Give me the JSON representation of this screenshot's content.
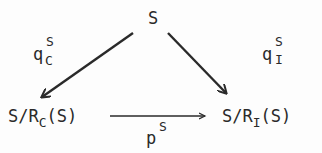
{
  "diagram": {
    "type": "commutative-triangle",
    "nodes": {
      "top": {
        "label": "S"
      },
      "left": {
        "base": "S/R",
        "sub": "C",
        "tail": "(S)"
      },
      "right": {
        "base": "S/R",
        "sub": "I",
        "tail": "(S)"
      }
    },
    "edges": {
      "left_arrow": {
        "from": "top",
        "to": "left",
        "base": "q",
        "sup": "S",
        "sub": "C"
      },
      "right_arrow": {
        "from": "top",
        "to": "right",
        "base": "q",
        "sup": "S",
        "sub": "I"
      },
      "bottom_arrow": {
        "from": "left",
        "to": "right",
        "base": "p",
        "sup": "S"
      }
    },
    "colors": {
      "ink": "#2a2a2a",
      "background": "#fdfdfd"
    }
  }
}
